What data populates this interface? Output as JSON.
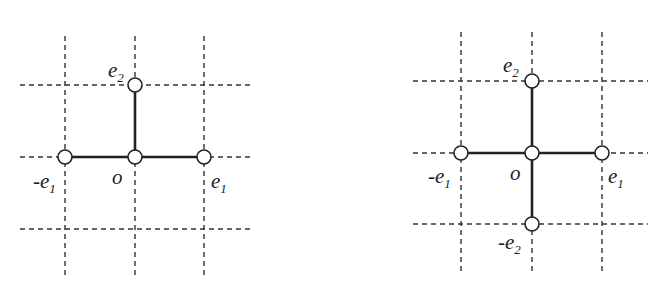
{
  "diagrams": [
    {
      "id": "left",
      "description": "T-shaped lattice graph",
      "grid": {
        "vlines": [
          65,
          135,
          204
        ],
        "hlines": [
          85,
          157,
          229
        ],
        "vspan": [
          36,
          276
        ],
        "hspan": [
          20,
          252
        ]
      },
      "nodes": [
        {
          "name": "e2",
          "x": 135,
          "y": 85,
          "label": "e",
          "sub": "2",
          "neg": false,
          "lx": 108,
          "ly": 77
        },
        {
          "name": "minus-e1",
          "x": 65,
          "y": 157,
          "label": "e",
          "sub": "1",
          "neg": true,
          "lx": 33,
          "ly": 188
        },
        {
          "name": "o",
          "x": 135,
          "y": 157,
          "label": "o",
          "sub": "",
          "neg": false,
          "lx": 112,
          "ly": 184
        },
        {
          "name": "e1",
          "x": 204,
          "y": 157,
          "label": "e",
          "sub": "1",
          "neg": false,
          "lx": 211,
          "ly": 188
        }
      ],
      "edges": [
        [
          "o",
          "e2"
        ],
        [
          "o",
          "minus-e1"
        ],
        [
          "o",
          "e1"
        ]
      ]
    },
    {
      "id": "right",
      "description": "Cross-shaped lattice graph",
      "grid": {
        "vlines": [
          461,
          532,
          602
        ],
        "hlines": [
          81,
          153,
          224
        ],
        "vspan": [
          32,
          274
        ],
        "hspan": [
          413,
          648
        ]
      },
      "nodes": [
        {
          "name": "e2",
          "x": 532,
          "y": 81,
          "label": "e",
          "sub": "2",
          "neg": false,
          "lx": 503,
          "ly": 72
        },
        {
          "name": "minus-e1",
          "x": 461,
          "y": 153,
          "label": "e",
          "sub": "1",
          "neg": true,
          "lx": 428,
          "ly": 183
        },
        {
          "name": "o",
          "x": 532,
          "y": 153,
          "label": "o",
          "sub": "",
          "neg": false,
          "lx": 510,
          "ly": 180
        },
        {
          "name": "e1",
          "x": 602,
          "y": 153,
          "label": "e",
          "sub": "1",
          "neg": false,
          "lx": 608,
          "ly": 183
        },
        {
          "name": "minus-e2",
          "x": 532,
          "y": 224,
          "label": "e",
          "sub": "2",
          "neg": true,
          "lx": 498,
          "ly": 249
        }
      ],
      "edges": [
        [
          "o",
          "e2"
        ],
        [
          "o",
          "minus-e1"
        ],
        [
          "o",
          "e1"
        ],
        [
          "o",
          "minus-e2"
        ]
      ]
    }
  ],
  "style": {
    "node_radius": 7,
    "line_color": "#222222",
    "grid_color": "#333333",
    "background": "#ffffff"
  }
}
